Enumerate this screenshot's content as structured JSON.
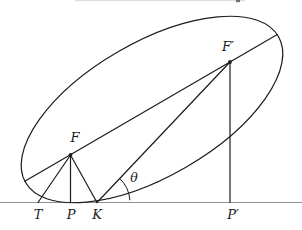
{
  "figure": {
    "kind": "ellipse-foci-tangent-diagram",
    "canvas": {
      "width": 302,
      "height": 230
    },
    "colors": {
      "ink": "#1c1c1c",
      "baseline": "#909090",
      "background": "#ffffff"
    },
    "ellipse": {
      "cx": 152,
      "cy": 109.5,
      "rx": 146,
      "ry": 67,
      "rotation": -30
    },
    "baseline": {
      "x1": 0,
      "y1": 202.5,
      "x2": 302,
      "y2": 202.5
    },
    "points": {
      "F": {
        "x": 70.5,
        "y": 155
      },
      "F_prime": {
        "x": 230,
        "y": 62
      },
      "T": {
        "x": 38,
        "y": 202.5
      },
      "P": {
        "x": 70.5,
        "y": 202.5
      },
      "K": {
        "x": 97,
        "y": 202.5
      },
      "P_prime": {
        "x": 230,
        "y": 202.5
      }
    },
    "segments": [
      {
        "name": "major-axis-line",
        "x1": 24.8,
        "y1": 181.3,
        "x2": 277.3,
        "y2": 34.5
      },
      {
        "name": "segment-F-T",
        "x1": 70.5,
        "y1": 155,
        "x2": 38,
        "y2": 202.5
      },
      {
        "name": "segment-F-P",
        "x1": 70.5,
        "y1": 155,
        "x2": 70.5,
        "y2": 202.5
      },
      {
        "name": "segment-F-K",
        "x1": 70.5,
        "y1": 155,
        "x2": 97,
        "y2": 202.5
      },
      {
        "name": "segment-K-Fprime",
        "x1": 97,
        "y1": 202.5,
        "x2": 230,
        "y2": 62
      },
      {
        "name": "segment-Fprime-Pprime",
        "x1": 230,
        "y1": 62,
        "x2": 230,
        "y2": 202.5
      }
    ],
    "angle_arc": {
      "cx": 97,
      "cy": 202.5,
      "r": 33,
      "start_deg": -4,
      "end_deg": -46.6
    },
    "focus_dots": [
      {
        "name": "focus-dot-F",
        "x": 70.5,
        "y": 155,
        "r": 1.9
      },
      {
        "name": "focus-dot-F-prime",
        "x": 230,
        "y": 62,
        "r": 1.9
      }
    ],
    "text_labels": [
      {
        "name": "label-F",
        "text": "F",
        "x": 75,
        "y": 142
      },
      {
        "name": "label-F-prime",
        "text": "F′",
        "x": 228,
        "y": 51
      },
      {
        "name": "label-T",
        "text": "T",
        "x": 38,
        "y": 219
      },
      {
        "name": "label-P",
        "text": "P",
        "x": 71,
        "y": 219
      },
      {
        "name": "label-K",
        "text": "K",
        "x": 97,
        "y": 219
      },
      {
        "name": "label-P-prime",
        "text": "P′",
        "x": 233,
        "y": 219
      },
      {
        "name": "label-theta",
        "text": "θ",
        "x": 134,
        "y": 182
      }
    ],
    "top_crop_artifact": {
      "x": 75,
      "y": 0,
      "width": 170,
      "height": 1.2,
      "mark_x": 236,
      "mark_y": 0,
      "mark_w": 4,
      "mark_h": 2.2
    }
  }
}
